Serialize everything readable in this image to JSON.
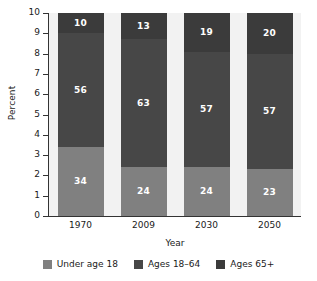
{
  "chart_data": {
    "type": "bar",
    "subtype": "stacked-bar-100-percent",
    "title": "",
    "xlabel": "Year",
    "ylabel": "Percent",
    "categories": [
      "1970",
      "2009",
      "2030",
      "2050"
    ],
    "ylim": [
      0,
      10
    ],
    "yticks": [
      "0",
      "1",
      "2",
      "3",
      "4",
      "5",
      "6",
      "7",
      "8",
      "9",
      "10"
    ],
    "grid": false,
    "legend_position": "bottom",
    "series": [
      {
        "name": "Under age 18",
        "color": "#808080",
        "values": [
          34,
          24,
          24,
          23
        ],
        "labels": [
          "34",
          "24",
          "24",
          "23"
        ]
      },
      {
        "name": "Ages 18–64",
        "color": "#474747",
        "values": [
          56,
          63,
          57,
          57
        ],
        "labels": [
          "56",
          "63",
          "57",
          "57"
        ]
      },
      {
        "name": "Ages 65+",
        "color": "#3b3b3b",
        "values": [
          10,
          13,
          19,
          20
        ],
        "labels": [
          "10",
          "13",
          "19",
          "20"
        ]
      }
    ]
  },
  "axes": {
    "y_title": "Percent",
    "x_title": "Year",
    "y_tick_labels": [
      "10",
      "9",
      "8",
      "7",
      "6",
      "5",
      "4",
      "3",
      "2",
      "1",
      "0"
    ],
    "x_tick_labels": [
      "1970",
      "2009",
      "2030",
      "2050"
    ]
  },
  "legend": {
    "items": [
      {
        "label": "Under age 18",
        "color": "#808080"
      },
      {
        "label": "Ages 18–64",
        "color": "#474747"
      },
      {
        "label": "Ages 65+",
        "color": "#3b3b3b"
      }
    ]
  },
  "colors": {
    "plot_background": "#f2f2f2",
    "page_background": "#ffffff",
    "axis": "#333333",
    "text": "#1a1a1a",
    "label_text": "#ffffff"
  }
}
